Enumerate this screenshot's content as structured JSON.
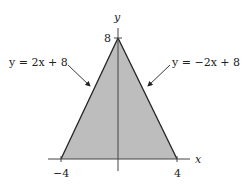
{
  "diagram": {
    "axes": {
      "x_label": "x",
      "y_label": "y",
      "x_ticks": [
        "−4",
        "4"
      ],
      "y_ticks": [
        "8"
      ]
    },
    "region": {
      "vertices": [
        [
          -4,
          0
        ],
        [
          0,
          8
        ],
        [
          4,
          0
        ]
      ],
      "fill_color": "#bdbdbd",
      "edge_color": "#222222"
    },
    "annotations": [
      {
        "text": "y = 2x + 8",
        "side": "left"
      },
      {
        "text": "y = −2x + 8",
        "side": "right"
      }
    ]
  }
}
